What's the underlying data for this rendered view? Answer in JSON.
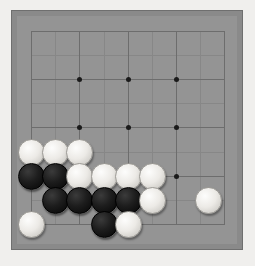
{
  "app": {
    "title": "Go Board",
    "board_size_label": "Go game board"
  },
  "board": {
    "surface_color": "#949494",
    "frame_color": "#8a8a8a",
    "line_color": "#6d6d6d",
    "minor_line_color": "#878787",
    "background_color": "#f0efed",
    "black_stone_color": "#141414",
    "white_stone_color": "#ebe9e5",
    "frame": {
      "x": 11,
      "y": 10,
      "width": 232,
      "height": 240
    },
    "grid": {
      "major_x": [
        31,
        79,
        128,
        176,
        224
      ],
      "major_y": [
        31,
        79,
        127,
        176,
        224
      ],
      "minor_x": [
        55,
        104,
        152,
        200
      ],
      "minor_y": [
        55,
        103,
        152,
        200
      ],
      "spacing": 48.3,
      "star_points": [
        {
          "x": 79,
          "y": 79
        },
        {
          "x": 128,
          "y": 79
        },
        {
          "x": 176,
          "y": 79
        },
        {
          "x": 79,
          "y": 127
        },
        {
          "x": 128,
          "y": 127
        },
        {
          "x": 176,
          "y": 127
        },
        {
          "x": 79,
          "y": 176
        },
        {
          "x": 128,
          "y": 176
        },
        {
          "x": 176,
          "y": 176
        }
      ]
    },
    "stones": [
      {
        "color": "white",
        "x": 31,
        "y": 152,
        "label": "W1"
      },
      {
        "color": "white",
        "x": 55,
        "y": 152,
        "label": "W2"
      },
      {
        "color": "white",
        "x": 79,
        "y": 152,
        "label": "W3"
      },
      {
        "color": "black",
        "x": 31,
        "y": 176,
        "label": "B1"
      },
      {
        "color": "black",
        "x": 55,
        "y": 176,
        "label": "B2"
      },
      {
        "color": "white",
        "x": 79,
        "y": 176,
        "label": "W4"
      },
      {
        "color": "white",
        "x": 104,
        "y": 176,
        "label": "W5"
      },
      {
        "color": "white",
        "x": 128,
        "y": 176,
        "label": "W6"
      },
      {
        "color": "white",
        "x": 152,
        "y": 176,
        "label": "W7"
      },
      {
        "color": "black",
        "x": 55,
        "y": 200,
        "label": "B3"
      },
      {
        "color": "black",
        "x": 79,
        "y": 200,
        "label": "B4"
      },
      {
        "color": "black",
        "x": 104,
        "y": 200,
        "label": "B5"
      },
      {
        "color": "black",
        "x": 128,
        "y": 200,
        "label": "B6"
      },
      {
        "color": "white",
        "x": 152,
        "y": 200,
        "label": "W8"
      },
      {
        "color": "white",
        "x": 208,
        "y": 200,
        "label": "W9"
      },
      {
        "color": "white",
        "x": 31,
        "y": 224,
        "label": "W10"
      },
      {
        "color": "black",
        "x": 104,
        "y": 224,
        "label": "B7"
      },
      {
        "color": "white",
        "x": 128,
        "y": 224,
        "label": "W11"
      }
    ],
    "counts": {
      "black_label": "Black stones",
      "black": 7,
      "white_label": "White stones",
      "white": 11
    }
  }
}
